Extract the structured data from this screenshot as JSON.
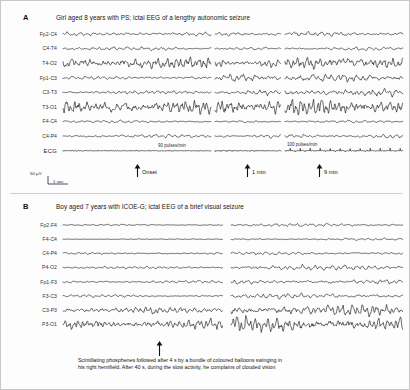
{
  "figure": {
    "background": "#fdfdfd",
    "trace_color": "#0e0e0e",
    "border_color": "#c8c8c8"
  },
  "panels": [
    {
      "id": "a",
      "letter": "A",
      "title": "Girl aged 8 years with PS; ictal EEG of a lengthy autonomic seizure",
      "channels": [
        {
          "label": "Fp2-C4",
          "amp": 2.0,
          "freq": 1.0,
          "seg_amp": [
            1.0,
            0.9,
            1.2
          ]
        },
        {
          "label": "C4-T4",
          "amp": 1.7,
          "freq": 0.95,
          "seg_amp": [
            1.1,
            0.8,
            1.0
          ]
        },
        {
          "label": "T4-O2",
          "amp": 4.6,
          "freq": 1.45,
          "seg_amp": [
            1.5,
            1.0,
            1.6
          ]
        },
        {
          "label": "Fp1-C3",
          "amp": 2.2,
          "freq": 1.05,
          "seg_amp": [
            0.8,
            1.9,
            2.0
          ]
        },
        {
          "label": "C3-T3",
          "amp": 2.1,
          "freq": 1.2,
          "seg_amp": [
            0.9,
            1.4,
            1.8
          ]
        },
        {
          "label": "T3-O1",
          "amp": 4.8,
          "freq": 1.55,
          "seg_amp": [
            1.6,
            1.7,
            2.1
          ]
        },
        {
          "label": "F4-C4",
          "amp": 1.4,
          "freq": 0.85,
          "seg_amp": [
            0.9,
            0.7,
            0.9
          ]
        },
        {
          "label": "C4-P4",
          "amp": 1.8,
          "freq": 1.0,
          "seg_amp": [
            1.0,
            1.0,
            1.1
          ]
        },
        {
          "label": "ECG",
          "amp": 3.2,
          "freq": 1.0,
          "seg_amp": [
            1.0,
            1.0,
            1.0
          ],
          "type": "ecg"
        }
      ],
      "segments": [
        {
          "x": 62,
          "width": 148
        },
        {
          "x": 214,
          "width": 66
        },
        {
          "x": 284,
          "width": 118
        }
      ],
      "rate_labels": [
        {
          "text": "90 pulses/min",
          "x": 157,
          "y": 142
        },
        {
          "text": "100 pulses/min",
          "x": 286,
          "y": 141
        }
      ],
      "markers": [
        {
          "label": "Onset",
          "x": 136
        },
        {
          "label": "1 min",
          "x": 246
        },
        {
          "label": "9 min",
          "x": 318
        }
      ],
      "scale": {
        "amplitude": "50 µV",
        "time": "1 sec"
      }
    },
    {
      "id": "b",
      "letter": "B",
      "title": "Boy aged 7 years with ICOE-G; ictal EEG of a brief visual seizure",
      "channels": [
        {
          "label": "Fp2-F4",
          "amp": 1.0,
          "freq": 0.9,
          "seg_amp": [
            0.7,
            1.5
          ]
        },
        {
          "label": "F4-C4",
          "amp": 0.8,
          "freq": 0.85,
          "seg_amp": [
            0.5,
            1.3
          ]
        },
        {
          "label": "C4-P4",
          "amp": 1.2,
          "freq": 1.0,
          "seg_amp": [
            0.9,
            1.3
          ]
        },
        {
          "label": "P4-O2",
          "amp": 1.4,
          "freq": 1.1,
          "seg_amp": [
            0.9,
            2.0
          ]
        },
        {
          "label": "Fp1-F3",
          "amp": 1.3,
          "freq": 1.0,
          "seg_amp": [
            1.0,
            1.8
          ]
        },
        {
          "label": "F3-C3",
          "amp": 1.4,
          "freq": 1.05,
          "seg_amp": [
            1.0,
            1.8
          ]
        },
        {
          "label": "C3-P3",
          "amp": 2.6,
          "freq": 1.35,
          "seg_amp": [
            1.4,
            2.4
          ]
        },
        {
          "label": "P3-O1",
          "amp": 3.2,
          "freq": 1.5,
          "seg_amp": [
            1.8,
            2.6
          ]
        }
      ],
      "segments": [
        {
          "x": 62,
          "width": 160
        },
        {
          "x": 230,
          "width": 172
        }
      ],
      "markers": [
        {
          "label": "",
          "x": 158
        }
      ],
      "caption": [
        "Scintillating phosphenes followed after 4 s by a bundle of coloured balloons swinging in",
        "his right hemifield. After 40 s, during the slow activity, he complains of clouded vision"
      ]
    }
  ]
}
